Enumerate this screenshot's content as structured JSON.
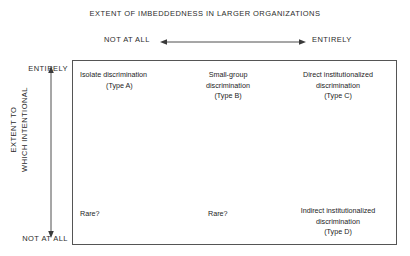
{
  "column_axis": {
    "title": "EXTENT OF IMBEDDEDNESS IN LARGER ORGANIZATIONS",
    "low_label": "NOT AT ALL",
    "high_label": "ENTIRELY"
  },
  "row_axis": {
    "title_line1": "EXTENT TO",
    "title_line2": "WHICH INTENTIONAL",
    "high_label": "ENTIRELY",
    "low_label": "NOT AT ALL"
  },
  "matrix": {
    "cells": [
      {
        "id": "type-a",
        "line1": "Isolate discrimination",
        "line2": "(Type A)"
      },
      {
        "id": "type-b",
        "line1": "Small-group",
        "line2": "discrimination",
        "line3": "(Type B)"
      },
      {
        "id": "type-c",
        "line1": "Direct institutionalized",
        "line2": "discrimination",
        "line3": "(Type C)"
      },
      {
        "id": "rare-1",
        "line1": "Rare?"
      },
      {
        "id": "rare-2",
        "line1": "Rare?"
      },
      {
        "id": "type-d",
        "line1": "Indirect institutionalized",
        "line2": "discrimination",
        "line3": "(Type D)"
      }
    ]
  },
  "colors": {
    "text": "#1d1d1d",
    "border": "#555555",
    "background": "#ffffff"
  }
}
